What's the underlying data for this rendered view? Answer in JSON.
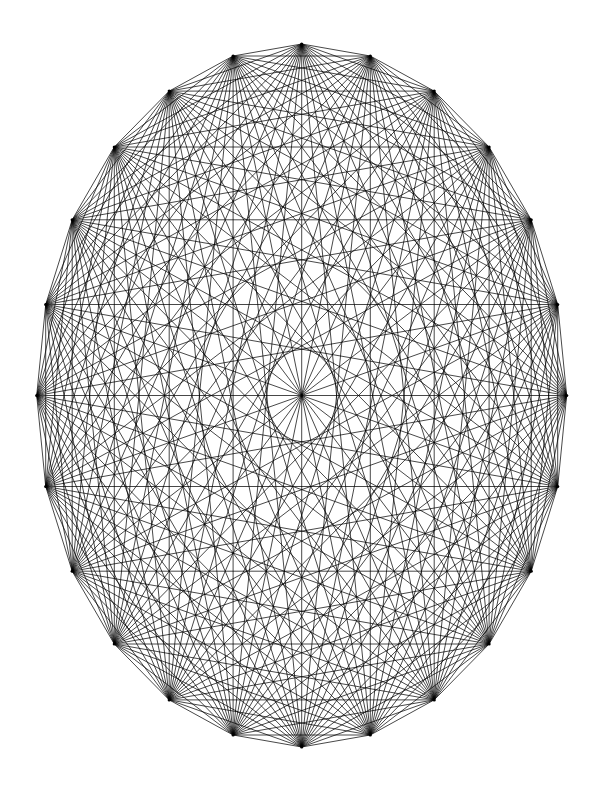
{
  "figure": {
    "type": "complete-graph",
    "canvas": {
      "width": 600,
      "height": 800,
      "background": "#ffffff"
    },
    "style": {
      "edge_color": "#000000",
      "edge_width": 0.72,
      "vertex_color": "#000000",
      "vertex_radius": 1.6,
      "antialias": true
    }
  },
  "chart_data": {
    "type": "diagram",
    "subtype": "complete-graph-circulant-ellipse",
    "vertex_count": 24,
    "edge_count": 276,
    "degree_per_vertex": 23,
    "layout": {
      "shape": "ellipse",
      "center_x": 301.7,
      "center_y": 395.5,
      "radius_x": 265.0,
      "radius_y": 351.5,
      "start_angle_deg": 90,
      "angle_step_deg": 15,
      "direction": "counterclockwise",
      "y_axis_down": true
    },
    "vertices": [
      {
        "index": 0,
        "angle_deg": 0,
        "x": 566.7,
        "y": 395.5
      },
      {
        "index": 1,
        "angle_deg": 15,
        "x": 557.7,
        "y": 304.5
      },
      {
        "index": 2,
        "angle_deg": 30,
        "x": 531.2,
        "y": 219.8
      },
      {
        "index": 3,
        "angle_deg": 45,
        "x": 489.1,
        "y": 147.0
      },
      {
        "index": 4,
        "angle_deg": 60,
        "x": 434.2,
        "y": 91.1
      },
      {
        "index": 5,
        "angle_deg": 75,
        "x": 370.3,
        "y": 56.0
      },
      {
        "index": 6,
        "angle_deg": 90,
        "x": 301.7,
        "y": 44.0
      },
      {
        "index": 7,
        "angle_deg": 105,
        "x": 233.1,
        "y": 56.0
      },
      {
        "index": 8,
        "angle_deg": 120,
        "x": 169.2,
        "y": 91.1
      },
      {
        "index": 9,
        "angle_deg": 135,
        "x": 114.3,
        "y": 147.0
      },
      {
        "index": 10,
        "angle_deg": 150,
        "x": 72.2,
        "y": 219.8
      },
      {
        "index": 11,
        "angle_deg": 165,
        "x": 45.7,
        "y": 304.5
      },
      {
        "index": 12,
        "angle_deg": 180,
        "x": 36.7,
        "y": 395.5
      },
      {
        "index": 13,
        "angle_deg": 195,
        "x": 45.7,
        "y": 486.5
      },
      {
        "index": 14,
        "angle_deg": 210,
        "x": 72.2,
        "y": 571.2
      },
      {
        "index": 15,
        "angle_deg": 225,
        "x": 114.3,
        "y": 644.0
      },
      {
        "index": 16,
        "angle_deg": 240,
        "x": 169.2,
        "y": 699.9
      },
      {
        "index": 17,
        "angle_deg": 255,
        "x": 233.1,
        "y": 735.0
      },
      {
        "index": 18,
        "angle_deg": 270,
        "x": 301.7,
        "y": 747.0
      },
      {
        "index": 19,
        "angle_deg": 285,
        "x": 370.3,
        "y": 735.0
      },
      {
        "index": 20,
        "angle_deg": 300,
        "x": 434.2,
        "y": 699.9
      },
      {
        "index": 21,
        "angle_deg": 315,
        "x": 489.1,
        "y": 644.0
      },
      {
        "index": 22,
        "angle_deg": 330,
        "x": 531.2,
        "y": 571.2
      },
      {
        "index": 23,
        "angle_deg": 345,
        "x": 557.7,
        "y": 486.5
      }
    ],
    "edge_rule": "every unordered pair of distinct vertices is joined by a straight chord",
    "notes": [
      "All 12 long diagonals (i, i+12) pass through the ellipse center, creating the dense central node.",
      "Chord families of equal step length form nested elliptical envelopes.",
      "No labels, axes, gridlines, legend or annotations are present in the figure."
    ],
    "xlabel": "",
    "ylabel": "",
    "legend": null,
    "grid": false
  }
}
